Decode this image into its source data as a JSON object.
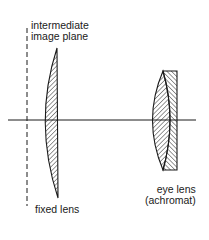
{
  "diagram": {
    "type": "optical-schematic",
    "labels": {
      "intermediate_line1": "intermediate",
      "intermediate_line2": "image plane",
      "fixed_lens": "fixed lens",
      "eye_lens_line1": "eye lens",
      "eye_lens_line2": "(achromat)"
    },
    "elements": [
      {
        "name": "optical-axis",
        "kind": "line"
      },
      {
        "name": "intermediate-image-plane",
        "kind": "dashed-line"
      },
      {
        "name": "fixed-lens",
        "kind": "plano-convex lens"
      },
      {
        "name": "eye-lens",
        "kind": "achromatic doublet"
      }
    ],
    "colors": {
      "ink": "#1a1a1a",
      "background": "#ffffff"
    }
  }
}
